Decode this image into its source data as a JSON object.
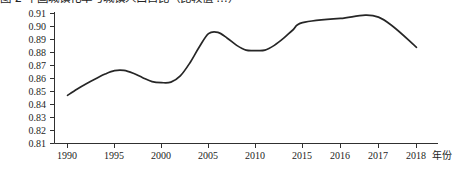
{
  "chart_data": {
    "type": "line",
    "title": "图 2 中国城镇化率与城镇人口占比（比较值 …）",
    "title_clipped": true,
    "xlabel": "年份",
    "ylabel": "",
    "ylim": [
      0.81,
      0.91
    ],
    "ytick_labels": [
      "0.91",
      "0.90",
      "0.89",
      "0.88",
      "0.87",
      "0.86",
      "0.85",
      "0.84",
      "0.83",
      "0.82",
      "0.81"
    ],
    "ytick_values": [
      0.91,
      0.9,
      0.89,
      0.88,
      0.87,
      0.86,
      0.85,
      0.84,
      0.83,
      0.82,
      0.81
    ],
    "xtick_labels": [
      "1990",
      "1995",
      "2000",
      "2005",
      "2010",
      "2015",
      "2016",
      "2017",
      "2018"
    ],
    "categories": [
      "1990",
      "1995",
      "2000",
      "2005",
      "2010",
      "2015",
      "2016",
      "2017",
      "2018"
    ],
    "values": [
      0.847,
      0.866,
      0.857,
      0.895,
      0.882,
      0.903,
      0.906,
      0.907,
      0.884
    ],
    "grid": false,
    "legend": "none",
    "series": [
      {
        "name": "比值",
        "color": "#262626",
        "values": [
          0.847,
          0.866,
          0.857,
          0.895,
          0.882,
          0.903,
          0.906,
          0.907,
          0.884
        ]
      }
    ],
    "dense_points": {
      "x": [
        1990,
        1991,
        1992,
        1993,
        1994,
        1995,
        1996,
        1997,
        1998,
        1999,
        2000,
        2001,
        2002,
        2003,
        2004,
        2005,
        2006,
        2007,
        2008,
        2009,
        2010,
        2011,
        2012,
        2013,
        2014,
        2015,
        2016,
        2017,
        2018
      ],
      "y": [
        0.847,
        0.8518,
        0.856,
        0.8598,
        0.8634,
        0.866,
        0.8662,
        0.864,
        0.8606,
        0.8576,
        0.8568,
        0.8572,
        0.862,
        0.8718,
        0.884,
        0.8945,
        0.8955,
        0.891,
        0.8855,
        0.8818,
        0.8815,
        0.8818,
        0.8855,
        0.891,
        0.8975,
        0.903,
        0.9062,
        0.9072,
        0.884
      ]
    },
    "axis_color": "#303030",
    "line_color": "#262626",
    "background": "#ffffff"
  }
}
